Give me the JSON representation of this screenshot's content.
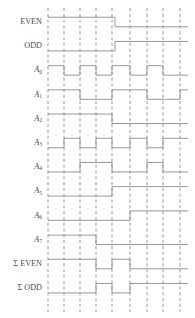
{
  "figure": {
    "type": "timing-diagram",
    "title": "",
    "width": 195,
    "height": 318,
    "background_color": "#ffffff",
    "wave_color": "#8c8c8c",
    "grid_color": "#8c8c8c",
    "label_color": "#4a4a4a"
  },
  "layout": {
    "label_right_x": 42,
    "track_left_x": 48,
    "track_right_x": 188,
    "row_height": 24.2,
    "first_row_center_y": 22,
    "wave_amplitude": 9.5
  },
  "grid": {
    "style": "dashed",
    "x_positions": [
      48,
      64,
      80,
      96,
      112,
      130,
      147,
      163,
      180
    ],
    "y_top": 8,
    "y_bottom": 312
  },
  "chart_data": {
    "type": "line",
    "xlabel": "",
    "ylabel": "",
    "signals": [
      {
        "name": "EVEN",
        "label": "EVEN",
        "sub": "",
        "row": 0,
        "transitions": [
          {
            "x": 48,
            "level": 1
          },
          {
            "x": 115,
            "level": 0
          },
          {
            "x": 188,
            "level": 0
          }
        ]
      },
      {
        "name": "ODD",
        "label": "ODD",
        "sub": "",
        "row": 1,
        "transitions": [
          {
            "x": 48,
            "level": 0
          },
          {
            "x": 115,
            "level": 1
          },
          {
            "x": 188,
            "level": 1
          }
        ]
      },
      {
        "name": "A0",
        "label": "A",
        "sub": "0",
        "row": 2,
        "transitions": [
          {
            "x": 48,
            "level": 1
          },
          {
            "x": 64,
            "level": 0
          },
          {
            "x": 80,
            "level": 1
          },
          {
            "x": 96,
            "level": 0
          },
          {
            "x": 112,
            "level": 1
          },
          {
            "x": 130,
            "level": 0
          },
          {
            "x": 147,
            "level": 1
          },
          {
            "x": 163,
            "level": 0
          },
          {
            "x": 188,
            "level": 0
          }
        ]
      },
      {
        "name": "A1",
        "label": "A",
        "sub": "1",
        "row": 3,
        "transitions": [
          {
            "x": 48,
            "level": 1
          },
          {
            "x": 80,
            "level": 0
          },
          {
            "x": 112,
            "level": 1
          },
          {
            "x": 147,
            "level": 0
          },
          {
            "x": 180,
            "level": 1
          },
          {
            "x": 188,
            "level": 1
          }
        ]
      },
      {
        "name": "A2",
        "label": "A",
        "sub": "2",
        "row": 4,
        "transitions": [
          {
            "x": 48,
            "level": 1
          },
          {
            "x": 112,
            "level": 0
          },
          {
            "x": 188,
            "level": 0
          }
        ]
      },
      {
        "name": "A3",
        "label": "A",
        "sub": "3",
        "row": 5,
        "transitions": [
          {
            "x": 48,
            "level": 0
          },
          {
            "x": 64,
            "level": 1
          },
          {
            "x": 80,
            "level": 0
          },
          {
            "x": 96,
            "level": 1
          },
          {
            "x": 112,
            "level": 0
          },
          {
            "x": 130,
            "level": 1
          },
          {
            "x": 147,
            "level": 0
          },
          {
            "x": 163,
            "level": 1
          },
          {
            "x": 188,
            "level": 1
          }
        ]
      },
      {
        "name": "A4",
        "label": "A",
        "sub": "4",
        "row": 6,
        "transitions": [
          {
            "x": 48,
            "level": 0
          },
          {
            "x": 80,
            "level": 1
          },
          {
            "x": 112,
            "level": 0
          },
          {
            "x": 147,
            "level": 1
          },
          {
            "x": 163,
            "level": 0
          },
          {
            "x": 188,
            "level": 0
          }
        ]
      },
      {
        "name": "A5",
        "label": "A",
        "sub": "5",
        "row": 7,
        "transitions": [
          {
            "x": 48,
            "level": 0
          },
          {
            "x": 112,
            "level": 1
          },
          {
            "x": 188,
            "level": 1
          }
        ]
      },
      {
        "name": "A6",
        "label": "A",
        "sub": "6",
        "row": 8,
        "transitions": [
          {
            "x": 48,
            "level": 0
          },
          {
            "x": 130,
            "level": 1
          },
          {
            "x": 188,
            "level": 1
          }
        ]
      },
      {
        "name": "A7",
        "label": "A",
        "sub": "7",
        "row": 9,
        "transitions": [
          {
            "x": 48,
            "level": 1
          },
          {
            "x": 96,
            "level": 0
          },
          {
            "x": 188,
            "level": 0
          }
        ]
      },
      {
        "name": "SUM-EVEN",
        "label": "Σ EVEN",
        "sub": "",
        "row": 10,
        "transitions": [
          {
            "x": 48,
            "level": 1
          },
          {
            "x": 96,
            "level": 0
          },
          {
            "x": 112,
            "level": 1
          },
          {
            "x": 130,
            "level": 0
          },
          {
            "x": 188,
            "level": 0
          }
        ]
      },
      {
        "name": "SUM-ODD",
        "label": "Σ ODD",
        "sub": "",
        "row": 11,
        "transitions": [
          {
            "x": 48,
            "level": 0
          },
          {
            "x": 96,
            "level": 1
          },
          {
            "x": 112,
            "level": 0
          },
          {
            "x": 130,
            "level": 1
          },
          {
            "x": 188,
            "level": 1
          }
        ]
      }
    ]
  }
}
